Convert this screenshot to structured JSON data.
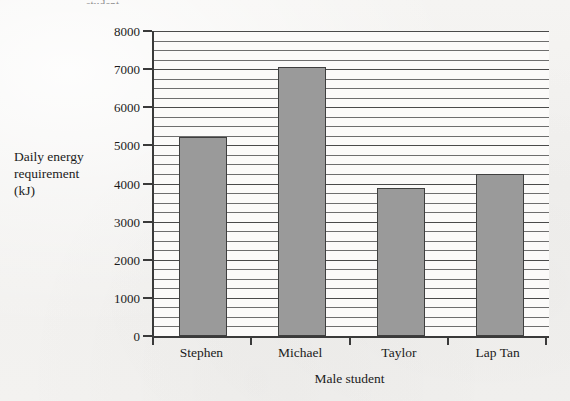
{
  "figure": {
    "top_caption_remnant": "student."
  },
  "chart_data": {
    "type": "bar",
    "title": "",
    "categories": [
      "Stephen",
      "Michael",
      "Taylor",
      "Lap Tan"
    ],
    "values": [
      5230,
      7050,
      3880,
      4250
    ],
    "xlabel": "Male student",
    "ylabel": "Daily energy requirement (kJ)",
    "ylabel_lines": [
      "Daily energy",
      "requirement",
      "(kJ)"
    ],
    "ylim": [
      0,
      8000
    ],
    "ytick_labels": [
      "0",
      "1000",
      "2000",
      "3000",
      "4000",
      "5000",
      "6000",
      "7000",
      "8000"
    ],
    "ytick_values": [
      0,
      1000,
      2000,
      3000,
      4000,
      5000,
      6000,
      7000,
      8000
    ],
    "minor_gridline_step": 250,
    "grid": true,
    "legend": false,
    "bar_color": "#9a9a9a",
    "bar_edge_color": "#3f3f3f",
    "axis_color": "#3a3a3a",
    "plot_background": "#fbfaf9",
    "page_background": "#f3f2f0"
  }
}
